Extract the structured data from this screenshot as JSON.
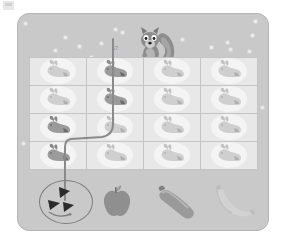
{
  "app": {
    "title": "Bunny Path Maze",
    "corner_mark_name": "screenshot-corner-mark"
  },
  "board": {
    "background_color": "#c9c9c9",
    "grid_background_color": "#e8e8e8",
    "line_color": "#c4c4c4",
    "path_color": "#8a8a8a",
    "character": "squirrel",
    "character_label": "",
    "hint_text": "17"
  },
  "grid": {
    "columns": 4,
    "rows": 4,
    "cell_icon": "bunny-icon",
    "cells": [
      {
        "row": 1,
        "col": 1,
        "icon": "bunny-icon",
        "shade": "light"
      },
      {
        "row": 1,
        "col": 2,
        "icon": "bunny-icon",
        "shade": "dark"
      },
      {
        "row": 1,
        "col": 3,
        "icon": "bunny-icon",
        "shade": "light"
      },
      {
        "row": 1,
        "col": 4,
        "icon": "bunny-icon",
        "shade": "light"
      },
      {
        "row": 2,
        "col": 1,
        "icon": "bunny-icon",
        "shade": "light"
      },
      {
        "row": 2,
        "col": 2,
        "icon": "bunny-icon",
        "shade": "dark"
      },
      {
        "row": 2,
        "col": 3,
        "icon": "bunny-icon",
        "shade": "light"
      },
      {
        "row": 2,
        "col": 4,
        "icon": "bunny-icon",
        "shade": "light"
      },
      {
        "row": 3,
        "col": 1,
        "icon": "bunny-icon",
        "shade": "dark"
      },
      {
        "row": 3,
        "col": 2,
        "icon": "bunny-icon",
        "shade": "light"
      },
      {
        "row": 3,
        "col": 3,
        "icon": "bunny-icon",
        "shade": "light"
      },
      {
        "row": 3,
        "col": 4,
        "icon": "bunny-icon",
        "shade": "light"
      },
      {
        "row": 4,
        "col": 1,
        "icon": "bunny-icon",
        "shade": "dark"
      },
      {
        "row": 4,
        "col": 2,
        "icon": "bunny-icon",
        "shade": "light"
      },
      {
        "row": 4,
        "col": 3,
        "icon": "bunny-icon",
        "shade": "light"
      },
      {
        "row": 4,
        "col": 4,
        "icon": "bunny-icon",
        "shade": "light"
      }
    ]
  },
  "path": {
    "stroke_color": "#8a8a8a",
    "stroke_width": 2,
    "start": "top-column-2",
    "end": "watermelon-target",
    "waypoints": "112,38 112,126 64,140 64,196"
  },
  "foods": [
    {
      "name": "watermelon",
      "label": "watermelon",
      "selected": true,
      "slices": 3
    },
    {
      "name": "apple",
      "label": "apple",
      "selected": false
    },
    {
      "name": "zucchini",
      "label": "zucchini",
      "selected": false
    },
    {
      "name": "banana",
      "label": "banana",
      "selected": false
    }
  ],
  "specks": [
    {
      "x": 46,
      "y": 22
    },
    {
      "x": 96,
      "y": 14
    },
    {
      "x": 103,
      "y": 17
    },
    {
      "x": 60,
      "y": 31
    },
    {
      "x": 36,
      "y": 35
    },
    {
      "x": 82,
      "y": 28
    },
    {
      "x": 72,
      "y": 42
    },
    {
      "x": 152,
      "y": 37
    },
    {
      "x": 163,
      "y": 24
    },
    {
      "x": 192,
      "y": 32
    },
    {
      "x": 208,
      "y": 27
    },
    {
      "x": 211,
      "y": 34
    },
    {
      "x": 233,
      "y": 20
    },
    {
      "x": 230,
      "y": 36
    },
    {
      "x": 6,
      "y": 8
    },
    {
      "x": 236,
      "y": 6
    },
    {
      "x": 243,
      "y": 92
    },
    {
      "x": 4,
      "y": 128
    }
  ]
}
